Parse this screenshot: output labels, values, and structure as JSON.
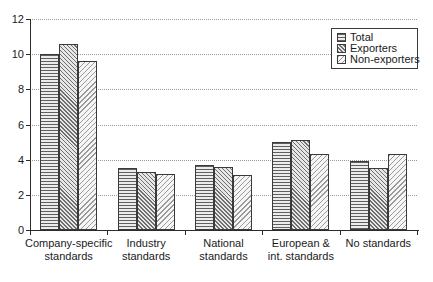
{
  "chart_data": {
    "type": "bar",
    "categories": [
      "Company-specific standards",
      "Industry standards",
      "National standards",
      "European & int. standards",
      "No standards"
    ],
    "categories_lines": [
      [
        "Company-specific",
        "standards"
      ],
      [
        "Industry",
        "standards"
      ],
      [
        "National",
        "standards"
      ],
      [
        "European &",
        "int. standards"
      ],
      [
        "No standards"
      ]
    ],
    "series": [
      {
        "name": "Total",
        "pattern": "horizontal-lines",
        "values": [
          10.0,
          3.5,
          3.7,
          5.0,
          3.9
        ]
      },
      {
        "name": "Exporters",
        "pattern": "diagonal-down-lines",
        "values": [
          10.6,
          3.3,
          3.6,
          5.1,
          3.5
        ]
      },
      {
        "name": "Non-exporters",
        "pattern": "diagonal-up-lines",
        "values": [
          9.6,
          3.2,
          3.1,
          4.3,
          4.3
        ]
      }
    ],
    "ylim": [
      0,
      12
    ],
    "yticks": [
      0,
      2,
      4,
      6,
      8,
      10,
      12
    ],
    "grid": "horizontal-dotted",
    "legend_position": "top-right",
    "colors": {
      "background": "#ffffff",
      "bar_border": "#3a3a3a",
      "hatch_total": "#5f5f5f",
      "hatch_exporters": "#6f6f6f",
      "hatch_non_exporters": "#9a9a9a",
      "gridline": "#9a9a9a",
      "axis": "#2b2b2b",
      "text": "#1a1a1a"
    }
  }
}
